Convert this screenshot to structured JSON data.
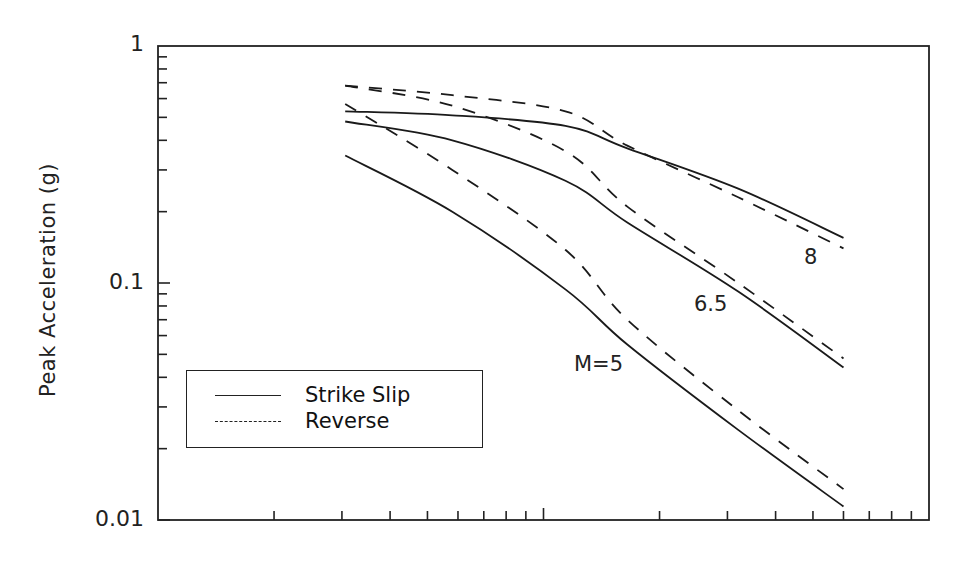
{
  "chart_data": {
    "type": "line",
    "title": "",
    "xlabel": "",
    "ylabel": "Peak Acceleration (g)",
    "xscale": "log",
    "yscale": "log",
    "xlim": [
      1,
      100
    ],
    "ylim": [
      0.01,
      1
    ],
    "x_tick_labels": [],
    "y_tick_labels": [
      "1",
      "0.1",
      "0.01"
    ],
    "grid": false,
    "legend": {
      "position": "lower-left",
      "entries": [
        {
          "label": "Strike Slip",
          "style": "solid"
        },
        {
          "label": "Reverse",
          "style": "dashed"
        }
      ]
    },
    "annotations": [
      {
        "text": "8",
        "x": 40,
        "y": 0.12
      },
      {
        "text": "6.5",
        "x": 24,
        "y": 0.082
      },
      {
        "text": "M=5",
        "x": 14,
        "y": 0.037
      }
    ],
    "x": [
      3.06,
      5.8,
      11.4,
      16.5,
      32,
      60
    ],
    "series": [
      {
        "name": "Strike Slip M=8",
        "style": "solid",
        "values": [
          0.53,
          0.51,
          0.46,
          0.37,
          0.25,
          0.155
        ]
      },
      {
        "name": "Reverse M=8",
        "style": "dashed",
        "values": [
          0.68,
          0.62,
          0.53,
          0.38,
          0.23,
          0.14
        ]
      },
      {
        "name": "Strike Slip M=6.5",
        "style": "solid",
        "values": [
          0.48,
          0.4,
          0.27,
          0.18,
          0.092,
          0.044
        ]
      },
      {
        "name": "Reverse M=6.5",
        "style": "dashed",
        "values": [
          0.68,
          0.56,
          0.36,
          0.21,
          0.1,
          0.048
        ]
      },
      {
        "name": "Strike Slip M=5",
        "style": "solid",
        "values": [
          0.345,
          0.2,
          0.094,
          0.055,
          0.024,
          0.0114
        ]
      },
      {
        "name": "Reverse M=5",
        "style": "dashed",
        "values": [
          0.57,
          0.3,
          0.138,
          0.07,
          0.029,
          0.0135
        ]
      }
    ]
  },
  "axis": {
    "y_label": "Peak Acceleration (g)",
    "y_ticks": [
      "1",
      "0.1",
      "0.01"
    ]
  },
  "labels": {
    "m8": "8",
    "m65": "6.5",
    "m5": "M=5"
  },
  "legend": {
    "solid_label": "Strike Slip",
    "dashed_label": "Reverse"
  }
}
